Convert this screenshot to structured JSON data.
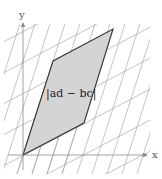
{
  "diagram": {
    "axes": {
      "x_label": "x",
      "y_label": "y"
    },
    "area_label": "|ad − bc|",
    "colors": {
      "fill": "#d4d4d4",
      "edge": "#333333",
      "grid": "#9a9a9a",
      "axis": "#8a8a8a"
    },
    "vertices": [
      [
        23,
        155
      ],
      [
        84,
        123
      ],
      [
        113,
        29
      ],
      [
        53,
        61
      ]
    ]
  }
}
